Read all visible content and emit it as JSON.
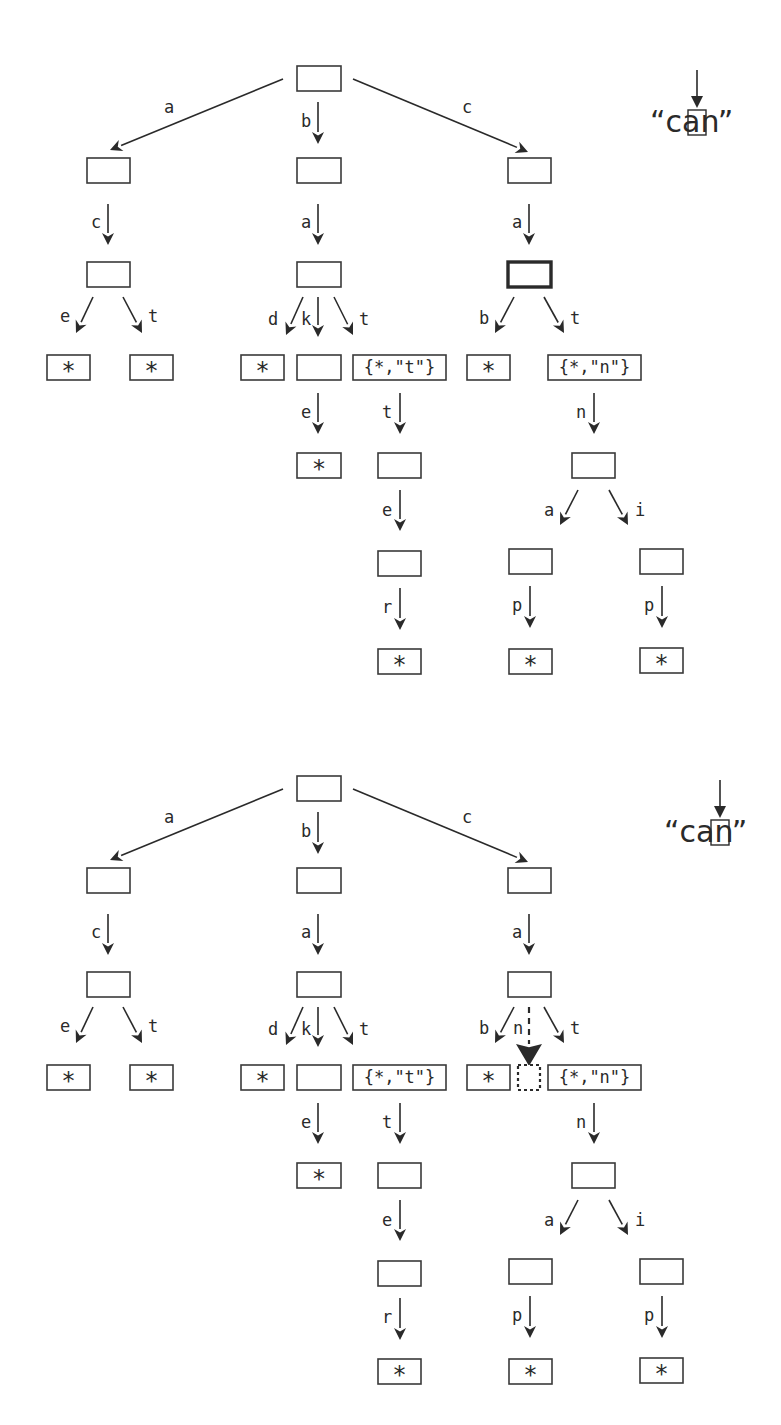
{
  "panels": [
    {
      "id": "top",
      "offset_y": 0,
      "query": {
        "open_quote": "“",
        "prefix": "ca",
        "current_char": "n",
        "close_quote": "”",
        "pointer_label": "current character pointer"
      },
      "nodes": [
        {
          "id": "root",
          "x": 297,
          "y": 66,
          "w": 44,
          "h": 25,
          "text": ""
        },
        {
          "id": "a",
          "x": 87,
          "y": 158,
          "w": 43,
          "h": 25,
          "text": ""
        },
        {
          "id": "b",
          "x": 297,
          "y": 158,
          "w": 44,
          "h": 25,
          "text": ""
        },
        {
          "id": "c",
          "x": 508,
          "y": 158,
          "w": 43,
          "h": 25,
          "text": ""
        },
        {
          "id": "ac",
          "x": 87,
          "y": 262,
          "w": 43,
          "h": 25,
          "text": ""
        },
        {
          "id": "ba",
          "x": 297,
          "y": 262,
          "w": 44,
          "h": 25,
          "text": ""
        },
        {
          "id": "ca",
          "x": 508,
          "y": 262,
          "w": 43,
          "h": 25,
          "text": "",
          "style": "bold"
        },
        {
          "id": "ace",
          "x": 47,
          "y": 355,
          "w": 43,
          "h": 25,
          "text": "*"
        },
        {
          "id": "act",
          "x": 130,
          "y": 355,
          "w": 43,
          "h": 25,
          "text": "*"
        },
        {
          "id": "bad",
          "x": 241,
          "y": 355,
          "w": 43,
          "h": 25,
          "text": "*"
        },
        {
          "id": "bak",
          "x": 297,
          "y": 355,
          "w": 44,
          "h": 25,
          "text": ""
        },
        {
          "id": "bat",
          "x": 353,
          "y": 355,
          "w": 93,
          "h": 25,
          "text": "{*,\"t\"}"
        },
        {
          "id": "cab",
          "x": 467,
          "y": 355,
          "w": 43,
          "h": 25,
          "text": "*"
        },
        {
          "id": "cat",
          "x": 548,
          "y": 355,
          "w": 93,
          "h": 25,
          "text": "{*,\"n\"}"
        },
        {
          "id": "bake",
          "x": 297,
          "y": 453,
          "w": 44,
          "h": 25,
          "text": "*"
        },
        {
          "id": "batt",
          "x": 378,
          "y": 453,
          "w": 43,
          "h": 25,
          "text": ""
        },
        {
          "id": "catn",
          "x": 572,
          "y": 453,
          "w": 43,
          "h": 25,
          "text": ""
        },
        {
          "id": "batte",
          "x": 378,
          "y": 551,
          "w": 43,
          "h": 25,
          "text": ""
        },
        {
          "id": "catna",
          "x": 509,
          "y": 549,
          "w": 43,
          "h": 25,
          "text": ""
        },
        {
          "id": "catni",
          "x": 640,
          "y": 549,
          "w": 43,
          "h": 25,
          "text": ""
        },
        {
          "id": "batter",
          "x": 378,
          "y": 649,
          "w": 43,
          "h": 25,
          "text": "*"
        },
        {
          "id": "catnap",
          "x": 509,
          "y": 649,
          "w": 43,
          "h": 25,
          "text": "*"
        },
        {
          "id": "catnip",
          "x": 640,
          "y": 648,
          "w": 43,
          "h": 25,
          "text": "*"
        }
      ],
      "edges": [
        {
          "from": [
            283,
            79
          ],
          "to": [
            110,
            150
          ],
          "label": "a",
          "lx": 164,
          "ly": 113
        },
        {
          "from": [
            318,
            102
          ],
          "to": [
            318,
            144
          ],
          "label": "b",
          "lx": 301,
          "ly": 127
        },
        {
          "from": [
            353,
            79
          ],
          "to": [
            528,
            152
          ],
          "label": "c",
          "lx": 462,
          "ly": 113
        },
        {
          "from": [
            108,
            204
          ],
          "to": [
            108,
            245
          ],
          "label": "c",
          "lx": 91,
          "ly": 228
        },
        {
          "from": [
            318,
            204
          ],
          "to": [
            318,
            245
          ],
          "label": "a",
          "lx": 301,
          "ly": 228
        },
        {
          "from": [
            529,
            204
          ],
          "to": [
            529,
            245
          ],
          "label": "a",
          "lx": 512,
          "ly": 228
        },
        {
          "from": [
            93,
            297
          ],
          "to": [
            76,
            333
          ],
          "label": "e",
          "lx": 60,
          "ly": 322
        },
        {
          "from": [
            123,
            297
          ],
          "to": [
            142,
            333
          ],
          "label": "t",
          "lx": 148,
          "ly": 322
        },
        {
          "from": [
            303,
            297
          ],
          "to": [
            286,
            335
          ],
          "label": "d",
          "lx": 268,
          "ly": 325
        },
        {
          "from": [
            318,
            297
          ],
          "to": [
            318,
            337
          ],
          "label": "k",
          "lx": 301,
          "ly": 325
        },
        {
          "from": [
            334,
            297
          ],
          "to": [
            353,
            335
          ],
          "label": "t",
          "lx": 359,
          "ly": 325
        },
        {
          "from": [
            514,
            297
          ],
          "to": [
            495,
            333
          ],
          "label": "b",
          "lx": 479,
          "ly": 324
        },
        {
          "from": [
            544,
            297
          ],
          "to": [
            564,
            333
          ],
          "label": "t",
          "lx": 570,
          "ly": 324
        },
        {
          "from": [
            318,
            393
          ],
          "to": [
            318,
            434
          ],
          "label": "e",
          "lx": 301,
          "ly": 418
        },
        {
          "from": [
            400,
            393
          ],
          "to": [
            400,
            434
          ],
          "label": "t",
          "lx": 382,
          "ly": 418
        },
        {
          "from": [
            594,
            393
          ],
          "to": [
            594,
            434
          ],
          "label": "n",
          "lx": 576,
          "ly": 418
        },
        {
          "from": [
            400,
            490
          ],
          "to": [
            400,
            531
          ],
          "label": "e",
          "lx": 382,
          "ly": 516
        },
        {
          "from": [
            578,
            490
          ],
          "to": [
            560,
            525
          ],
          "label": "a",
          "lx": 544,
          "ly": 516
        },
        {
          "from": [
            609,
            490
          ],
          "to": [
            628,
            525
          ],
          "label": "i",
          "lx": 635,
          "ly": 516
        },
        {
          "from": [
            400,
            588
          ],
          "to": [
            400,
            630
          ],
          "label": "r",
          "lx": 382,
          "ly": 613
        },
        {
          "from": [
            530,
            586
          ],
          "to": [
            530,
            628
          ],
          "label": "p",
          "lx": 512,
          "ly": 611
        },
        {
          "from": [
            662,
            586
          ],
          "to": [
            662,
            628
          ],
          "label": "p",
          "lx": 644,
          "ly": 611
        }
      ]
    },
    {
      "id": "bottom",
      "offset_y": 710,
      "query": {
        "open_quote": "“",
        "prefix": "ca",
        "current_char": "n",
        "close_quote": "”",
        "pointer_label": "current character pointer"
      },
      "nodes": [
        {
          "id": "root",
          "x": 297,
          "y": 66,
          "w": 44,
          "h": 25,
          "text": ""
        },
        {
          "id": "a",
          "x": 87,
          "y": 158,
          "w": 43,
          "h": 25,
          "text": ""
        },
        {
          "id": "b",
          "x": 297,
          "y": 158,
          "w": 44,
          "h": 25,
          "text": ""
        },
        {
          "id": "c",
          "x": 508,
          "y": 158,
          "w": 43,
          "h": 25,
          "text": ""
        },
        {
          "id": "ac",
          "x": 87,
          "y": 262,
          "w": 43,
          "h": 25,
          "text": ""
        },
        {
          "id": "ba",
          "x": 297,
          "y": 262,
          "w": 44,
          "h": 25,
          "text": ""
        },
        {
          "id": "ca",
          "x": 508,
          "y": 262,
          "w": 43,
          "h": 25,
          "text": ""
        },
        {
          "id": "ace",
          "x": 47,
          "y": 355,
          "w": 43,
          "h": 25,
          "text": "*"
        },
        {
          "id": "act",
          "x": 130,
          "y": 355,
          "w": 43,
          "h": 25,
          "text": "*"
        },
        {
          "id": "bad",
          "x": 241,
          "y": 355,
          "w": 43,
          "h": 25,
          "text": "*"
        },
        {
          "id": "bak",
          "x": 297,
          "y": 355,
          "w": 44,
          "h": 25,
          "text": ""
        },
        {
          "id": "bat",
          "x": 353,
          "y": 355,
          "w": 93,
          "h": 25,
          "text": "{*,\"t\"}"
        },
        {
          "id": "cab",
          "x": 467,
          "y": 355,
          "w": 43,
          "h": 25,
          "text": "*"
        },
        {
          "id": "can",
          "x": 518,
          "y": 355,
          "w": 22,
          "h": 25,
          "text": "",
          "style": "dotted"
        },
        {
          "id": "cat",
          "x": 548,
          "y": 355,
          "w": 93,
          "h": 25,
          "text": "{*,\"n\"}"
        },
        {
          "id": "bake",
          "x": 297,
          "y": 453,
          "w": 44,
          "h": 25,
          "text": "*"
        },
        {
          "id": "batt",
          "x": 378,
          "y": 453,
          "w": 43,
          "h": 25,
          "text": ""
        },
        {
          "id": "catn",
          "x": 572,
          "y": 453,
          "w": 43,
          "h": 25,
          "text": ""
        },
        {
          "id": "batte",
          "x": 378,
          "y": 551,
          "w": 43,
          "h": 25,
          "text": ""
        },
        {
          "id": "catna",
          "x": 509,
          "y": 549,
          "w": 43,
          "h": 25,
          "text": ""
        },
        {
          "id": "catni",
          "x": 640,
          "y": 549,
          "w": 43,
          "h": 25,
          "text": ""
        },
        {
          "id": "batter",
          "x": 378,
          "y": 649,
          "w": 43,
          "h": 25,
          "text": "*"
        },
        {
          "id": "catnap",
          "x": 509,
          "y": 649,
          "w": 43,
          "h": 25,
          "text": "*"
        },
        {
          "id": "catnip",
          "x": 640,
          "y": 648,
          "w": 43,
          "h": 25,
          "text": "*"
        }
      ],
      "edges": [
        {
          "from": [
            283,
            79
          ],
          "to": [
            110,
            150
          ],
          "label": "a",
          "lx": 164,
          "ly": 113
        },
        {
          "from": [
            318,
            102
          ],
          "to": [
            318,
            144
          ],
          "label": "b",
          "lx": 301,
          "ly": 127
        },
        {
          "from": [
            353,
            79
          ],
          "to": [
            528,
            152
          ],
          "label": "c",
          "lx": 462,
          "ly": 113
        },
        {
          "from": [
            108,
            204
          ],
          "to": [
            108,
            245
          ],
          "label": "c",
          "lx": 91,
          "ly": 228
        },
        {
          "from": [
            318,
            204
          ],
          "to": [
            318,
            245
          ],
          "label": "a",
          "lx": 301,
          "ly": 228
        },
        {
          "from": [
            529,
            204
          ],
          "to": [
            529,
            245
          ],
          "label": "a",
          "lx": 512,
          "ly": 228
        },
        {
          "from": [
            93,
            297
          ],
          "to": [
            76,
            333
          ],
          "label": "e",
          "lx": 60,
          "ly": 322
        },
        {
          "from": [
            123,
            297
          ],
          "to": [
            142,
            333
          ],
          "label": "t",
          "lx": 148,
          "ly": 322
        },
        {
          "from": [
            303,
            297
          ],
          "to": [
            286,
            335
          ],
          "label": "d",
          "lx": 268,
          "ly": 325
        },
        {
          "from": [
            318,
            297
          ],
          "to": [
            318,
            337
          ],
          "label": "k",
          "lx": 301,
          "ly": 325
        },
        {
          "from": [
            334,
            297
          ],
          "to": [
            353,
            335
          ],
          "label": "t",
          "lx": 359,
          "ly": 325
        },
        {
          "from": [
            514,
            297
          ],
          "to": [
            495,
            333
          ],
          "label": "b",
          "lx": 479,
          "ly": 324
        },
        {
          "from": [
            529,
            297
          ],
          "to": [
            529,
            356
          ],
          "label": "n",
          "lx": 513,
          "ly": 324,
          "style": "dashed",
          "big_head": true
        },
        {
          "from": [
            544,
            297
          ],
          "to": [
            564,
            333
          ],
          "label": "t",
          "lx": 570,
          "ly": 324
        },
        {
          "from": [
            318,
            393
          ],
          "to": [
            318,
            434
          ],
          "label": "e",
          "lx": 301,
          "ly": 418
        },
        {
          "from": [
            400,
            393
          ],
          "to": [
            400,
            434
          ],
          "label": "t",
          "lx": 382,
          "ly": 418
        },
        {
          "from": [
            594,
            393
          ],
          "to": [
            594,
            434
          ],
          "label": "n",
          "lx": 576,
          "ly": 418
        },
        {
          "from": [
            400,
            490
          ],
          "to": [
            400,
            531
          ],
          "label": "e",
          "lx": 382,
          "ly": 516
        },
        {
          "from": [
            578,
            490
          ],
          "to": [
            560,
            525
          ],
          "label": "a",
          "lx": 544,
          "ly": 516
        },
        {
          "from": [
            609,
            490
          ],
          "to": [
            628,
            525
          ],
          "label": "i",
          "lx": 635,
          "ly": 516
        },
        {
          "from": [
            400,
            588
          ],
          "to": [
            400,
            630
          ],
          "label": "r",
          "lx": 382,
          "ly": 613
        },
        {
          "from": [
            530,
            586
          ],
          "to": [
            530,
            628
          ],
          "label": "p",
          "lx": 512,
          "ly": 611
        },
        {
          "from": [
            662,
            586
          ],
          "to": [
            662,
            628
          ],
          "label": "p",
          "lx": 644,
          "ly": 611
        }
      ]
    }
  ]
}
